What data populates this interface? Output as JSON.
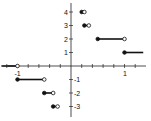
{
  "chart_data": {
    "type": "line",
    "title": "",
    "xlabel": "",
    "ylabel": "",
    "function": "y = floor(1/x)",
    "x_ticks_labeled": [
      "-1",
      "1"
    ],
    "x_minor_tick_step": 0.2,
    "y_ticks": [
      "4",
      "3",
      "2",
      "1",
      "-1",
      "-2",
      "-3"
    ],
    "xlim": [
      -1.3,
      1.35
    ],
    "ylim": [
      -3.5,
      4.6
    ],
    "grid": false,
    "legend": null,
    "segments": [
      {
        "y": 0,
        "x_start": -1.3,
        "x_end": -1,
        "start_closed": false,
        "end_closed": false
      },
      {
        "y": -1,
        "x_start": -1,
        "x_end": -0.5,
        "start_closed": true,
        "end_closed": false
      },
      {
        "y": -2,
        "x_start": -0.5,
        "x_end": -0.333,
        "start_closed": true,
        "end_closed": false
      },
      {
        "y": -3,
        "x_start": -0.333,
        "x_end": -0.25,
        "start_closed": true,
        "end_closed": false
      },
      {
        "y": 4,
        "x_start": 0.2,
        "x_end": 0.25,
        "start_closed": true,
        "end_closed": false
      },
      {
        "y": 3,
        "x_start": 0.25,
        "x_end": 0.333,
        "start_closed": true,
        "end_closed": false
      },
      {
        "y": 2,
        "x_start": 0.5,
        "x_end": 1,
        "start_closed": true,
        "end_closed": false
      },
      {
        "y": 1,
        "x_start": 1,
        "x_end": 1.35,
        "start_closed": true,
        "end_closed": false
      }
    ]
  }
}
